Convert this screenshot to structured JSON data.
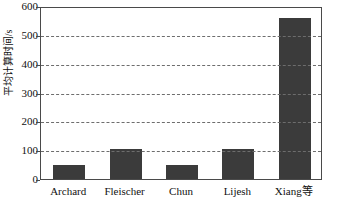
{
  "chart_data": {
    "type": "bar",
    "title": "",
    "subtitle": "",
    "xlabel": "",
    "ylabel": "平均计算时间/s",
    "categories": [
      "Archard",
      "Fleischer",
      "Chun",
      "Lijesh",
      "Xiang等"
    ],
    "values": [
      50,
      105,
      50,
      105,
      560
    ],
    "ylim": [
      0,
      600
    ],
    "yticks": [
      0,
      100,
      200,
      300,
      400,
      500,
      600
    ],
    "ytick_labels": [
      "0",
      "100",
      "200",
      "300",
      "400",
      "500",
      "600"
    ],
    "grid": "horizontal-dashed",
    "legend": "none",
    "bar_color": "#3b3b3b",
    "axis_color": "#4a4a4a",
    "grid_color": "#6d6d6d",
    "background": "#ffffff"
  }
}
